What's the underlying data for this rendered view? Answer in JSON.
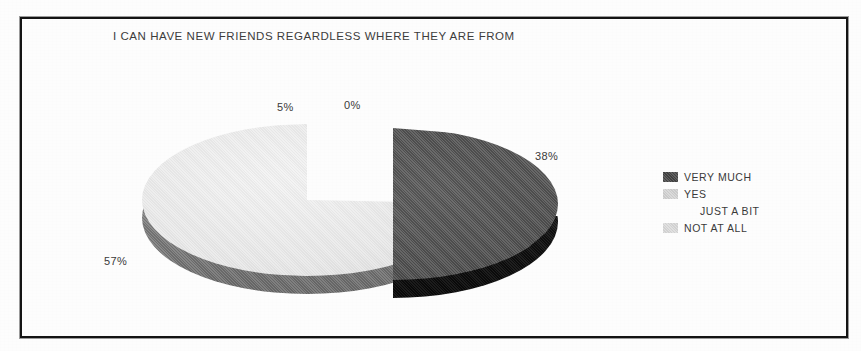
{
  "document": {
    "background_color": "#ffffff",
    "frame_color": "#141414",
    "type": "scanned-page"
  },
  "chart_data": {
    "type": "pie",
    "title": "I CAN HAVE NEW FRIENDS REGARDLESS WHERE THEY ARE FROM",
    "three_d": true,
    "exploded": true,
    "exploded_slice": "VERY MUCH",
    "categories": [
      "VERY MUCH",
      "YES",
      "JUST A BIT",
      "NOT AT ALL"
    ],
    "values": [
      38,
      57,
      5,
      0
    ],
    "value_unit": "%",
    "data_labels": [
      "38%",
      "57%",
      "5%",
      "0%"
    ],
    "slice_colors": [
      "#545454",
      "#e9e9e9",
      "#ffffff",
      "#dcdcdc"
    ],
    "legend_position": "right",
    "grid": false,
    "xlabel": "",
    "ylabel": ""
  },
  "title": {
    "text": "I CAN HAVE NEW FRIENDS REGARDLESS WHERE THEY ARE FROM"
  },
  "labels": {
    "pct_very_much": "38%",
    "pct_yes": "57%",
    "pct_just_a_bit": "5%",
    "pct_not_at_all": "0%"
  },
  "legend": {
    "items": [
      {
        "label": "VERY  MUCH",
        "color": "#4f4f4f",
        "has_swatch": true,
        "indented": false
      },
      {
        "label": "YES",
        "color": "#d5d5d5",
        "has_swatch": true,
        "indented": false
      },
      {
        "label": "JUST A BIT",
        "color": "#ffffff",
        "has_swatch": false,
        "indented": true
      },
      {
        "label": "NOT AT ALL",
        "color": "#dcdcdc",
        "has_swatch": true,
        "indented": false
      }
    ]
  }
}
